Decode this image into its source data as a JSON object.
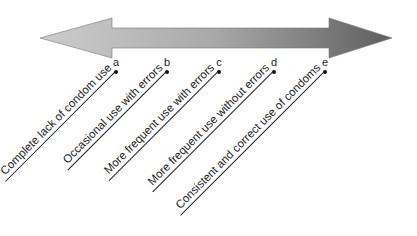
{
  "diagram": {
    "arrow": {
      "direction": "bidirectional",
      "gradient_start": "#c4c4c4",
      "gradient_end": "#6a6a6a"
    },
    "points": [
      {
        "letter": "a",
        "label": "Complete lack of condom use",
        "x": 116
      },
      {
        "letter": "b",
        "label": "Occasional use with errors",
        "x": 167
      },
      {
        "letter": "c",
        "label": "More frequent use with errors",
        "x": 219
      },
      {
        "letter": "d",
        "label": "More frequent use without errors",
        "x": 274
      },
      {
        "letter": "e",
        "label": "Consistent and correct use of condoms",
        "x": 325
      }
    ]
  }
}
